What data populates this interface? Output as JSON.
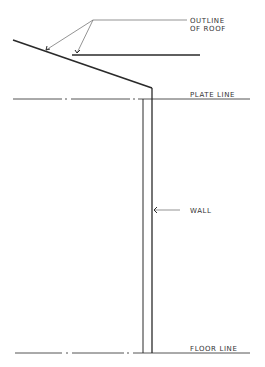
{
  "diagram": {
    "type": "architectural-section",
    "labels": {
      "roof_outline_line1": "OUTLINE",
      "roof_outline_line2": "OF ROOF",
      "plate_line": "PLATE LINE",
      "wall": "WALL",
      "floor_line": "FLOOR LINE"
    },
    "colors": {
      "line": "#2a2a2a",
      "leader": "#666666",
      "background": "#ffffff"
    }
  }
}
